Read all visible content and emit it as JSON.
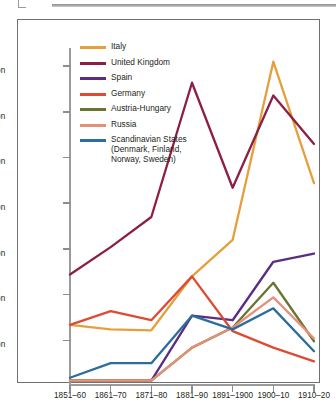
{
  "figure": {
    "frame_visible": true
  },
  "chart_data": {
    "type": "line",
    "title": "",
    "xlabel": "",
    "ylabel": "",
    "categories": [
      "1851–60",
      "1861–70",
      "1871–80",
      "1881–90",
      "1891–1900",
      "1900–10",
      "1910–20"
    ],
    "ylim": [
      0,
      3.7
    ],
    "yticks": [
      0.5,
      1,
      1.5,
      2,
      2.5,
      3,
      3.5
    ],
    "ytick_labels": [
      ".5\nmillion",
      "1\nmillion",
      "1.5\nmillion",
      "2\nmillion",
      "2.5\nmillion",
      "3\nmillion",
      "3.5\nmillion"
    ],
    "y_units": "million",
    "grid": false,
    "legend_position": "inside-top-left",
    "series": [
      {
        "name": "Italy",
        "color": "#e3a03c",
        "values": [
          0.67,
          0.62,
          0.61,
          1.2,
          1.6,
          3.55,
          2.22
        ]
      },
      {
        "name": "United Kingdom",
        "color": "#8d1f45",
        "values": [
          1.22,
          1.52,
          1.85,
          3.32,
          2.17,
          3.18,
          2.65
        ]
      },
      {
        "name": "Spain",
        "color": "#5b2d82",
        "values": [
          0.06,
          0.06,
          0.06,
          0.77,
          0.72,
          1.36,
          1.45
        ]
      },
      {
        "name": "Germany",
        "color": "#de4b34",
        "values": [
          0.67,
          0.82,
          0.72,
          1.2,
          0.6,
          0.42,
          0.27
        ]
      },
      {
        "name": "Austria-Hungary",
        "color": "#6c7330",
        "values": [
          0.06,
          0.06,
          0.06,
          0.42,
          0.64,
          1.13,
          0.49
        ]
      },
      {
        "name": "Russia",
        "color": "#e3917a",
        "values": [
          0.06,
          0.06,
          0.06,
          0.42,
          0.64,
          0.97,
          0.52
        ]
      },
      {
        "name": "Scandinavian States (Denmark, Finland, Norway, Sweden)",
        "color": "#2b6d9c",
        "values": [
          0.09,
          0.25,
          0.25,
          0.77,
          0.62,
          0.85,
          0.38
        ]
      }
    ]
  },
  "legend": {
    "items": [
      {
        "label": "Italy"
      },
      {
        "label": "United Kingdom"
      },
      {
        "label": "Spain"
      },
      {
        "label": "Germany"
      },
      {
        "label": "Austria-Hungary"
      },
      {
        "label": "Russia"
      },
      {
        "label": "Scandinavian States\n(Denmark, Finland,\nNorway, Sweden)"
      }
    ]
  }
}
